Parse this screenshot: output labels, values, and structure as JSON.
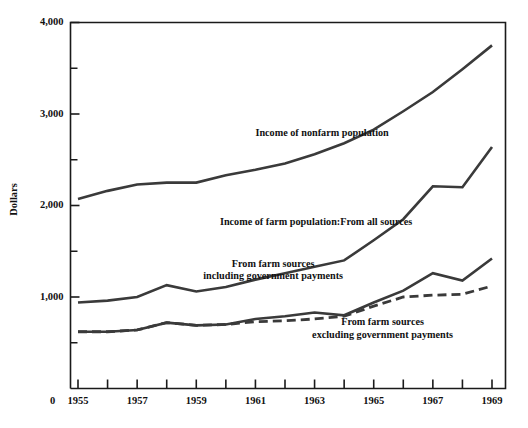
{
  "chart_data": {
    "type": "line",
    "title": "",
    "xlabel": "",
    "ylabel": "Dollars",
    "xlim": [
      1955,
      1969
    ],
    "ylim": [
      0,
      4000
    ],
    "grid": false,
    "legend_position": "inline-annotations",
    "x": [
      1955,
      1956,
      1957,
      1958,
      1959,
      1960,
      1961,
      1962,
      1963,
      1964,
      1965,
      1966,
      1967,
      1968,
      1969
    ],
    "y_ticks_major": [
      0,
      1000,
      2000,
      3000,
      4000
    ],
    "y_ticks_minor": [
      500,
      1500,
      2500,
      3500
    ],
    "x_tick_labels": [
      "1955",
      "1957",
      "1959",
      "1961",
      "1963",
      "1965",
      "1967",
      "1969"
    ],
    "zero_label": "0",
    "y_tick_labels": {
      "1000": "1,000",
      "2000": "2,000",
      "3000": "3,000",
      "4000": "4,000"
    },
    "series": [
      {
        "name": "Income of nonfarm population",
        "style": "solid",
        "values": [
          2070,
          2160,
          2230,
          2250,
          2250,
          2330,
          2390,
          2460,
          2560,
          2680,
          2830,
          3030,
          3240,
          3490,
          3750
        ],
        "label_lines": [
          "Income of nonfarm population"
        ],
        "label_x": 1961.0,
        "label_y": 2760
      },
      {
        "name": "Income of farm population: From all sources",
        "style": "solid",
        "values": [
          940,
          960,
          1000,
          1130,
          1060,
          1110,
          1190,
          1260,
          1330,
          1400,
          1620,
          1850,
          2210,
          2200,
          2640
        ],
        "label_lines": [
          "Income of farm population:From all sources"
        ],
        "label_x": 1959.8,
        "label_y": 1790
      },
      {
        "name": "From farm sources including government payments",
        "style": "solid",
        "values": [
          620,
          620,
          640,
          720,
          690,
          700,
          760,
          790,
          830,
          800,
          940,
          1070,
          1260,
          1180,
          1420
        ],
        "label_lines": [
          "From farm sources",
          "including government payments"
        ],
        "label_x": 1961.6,
        "label_y": 1330
      },
      {
        "name": "From farm sources excluding government payments",
        "style": "dashed",
        "values": [
          620,
          620,
          640,
          720,
          690,
          700,
          730,
          740,
          760,
          790,
          900,
          1000,
          1020,
          1030,
          1120
        ],
        "label_lines": [
          "From farm sources",
          "excluding government payments"
        ],
        "label_x": 1965.3,
        "label_y": 690
      }
    ]
  },
  "colors": {
    "line": "#3a3a3a",
    "axis": "#1a1a1a",
    "text": "#111111",
    "background": "#ffffff"
  }
}
